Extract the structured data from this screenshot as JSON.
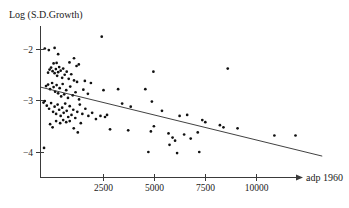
{
  "chart_data": {
    "type": "scatter",
    "title": "",
    "subtitle": "",
    "xlabel": "adp 1960",
    "ylabel": "Log (S.D.Growth)",
    "grid": false,
    "legend": null,
    "xlim": [
      0,
      11500
    ],
    "ylim": [
      -4.35,
      -1.55
    ],
    "xticks": [
      2500,
      5000,
      7500,
      10000
    ],
    "xtick_labels": [
      "2500",
      "5000",
      "7500",
      "10000"
    ],
    "yticks": [
      -2,
      -3,
      -4
    ],
    "ytick_labels": [
      "−2",
      "−3",
      "−4"
    ],
    "annotations": [],
    "series": [
      {
        "name": "countries",
        "marker": "filled-circle",
        "color": "#111111",
        "points": [
          [
            120,
            -3.04
          ],
          [
            170,
            -1.99
          ],
          [
            330,
            -2.02
          ],
          [
            520,
            -2.28
          ],
          [
            560,
            -1.98
          ],
          [
            640,
            -2.27
          ],
          [
            700,
            -2.1
          ],
          [
            2430,
            -1.76
          ],
          [
            1150,
            -2.26
          ],
          [
            1330,
            -2.18
          ],
          [
            1430,
            -2.33
          ],
          [
            1520,
            -2.3
          ],
          [
            300,
            -2.46
          ],
          [
            360,
            -2.4
          ],
          [
            420,
            -2.36
          ],
          [
            480,
            -2.43
          ],
          [
            560,
            -2.47
          ],
          [
            610,
            -2.39
          ],
          [
            660,
            -2.52
          ],
          [
            700,
            -2.45
          ],
          [
            740,
            -2.35
          ],
          [
            800,
            -2.42
          ],
          [
            860,
            -2.56
          ],
          [
            900,
            -2.38
          ],
          [
            960,
            -2.5
          ],
          [
            1040,
            -2.44
          ],
          [
            1120,
            -2.58
          ],
          [
            1220,
            -2.49
          ],
          [
            1330,
            -2.61
          ],
          [
            1450,
            -2.64
          ],
          [
            1760,
            -2.62
          ],
          [
            4480,
            -2.44
          ],
          [
            7430,
            -2.38
          ],
          [
            220,
            -2.72
          ],
          [
            300,
            -2.69
          ],
          [
            380,
            -2.78
          ],
          [
            460,
            -2.66
          ],
          [
            520,
            -2.74
          ],
          [
            580,
            -2.83
          ],
          [
            640,
            -2.7
          ],
          [
            700,
            -2.86
          ],
          [
            760,
            -2.76
          ],
          [
            820,
            -2.92
          ],
          [
            880,
            -2.68
          ],
          [
            940,
            -2.88
          ],
          [
            1020,
            -2.8
          ],
          [
            1090,
            -2.95
          ],
          [
            1180,
            -2.73
          ],
          [
            1280,
            -2.9
          ],
          [
            1390,
            -2.84
          ],
          [
            1530,
            -2.98
          ],
          [
            1700,
            -2.79
          ],
          [
            1880,
            -2.87
          ],
          [
            2500,
            -2.8
          ],
          [
            3080,
            -2.78
          ],
          [
            2000,
            -2.66
          ],
          [
            170,
            -3.01
          ],
          [
            250,
            -3.1
          ],
          [
            340,
            -3.16
          ],
          [
            420,
            -3.05
          ],
          [
            500,
            -3.22
          ],
          [
            560,
            -3.12
          ],
          [
            620,
            -3.26
          ],
          [
            680,
            -3.08
          ],
          [
            740,
            -3.18
          ],
          [
            800,
            -3.3
          ],
          [
            860,
            -3.14
          ],
          [
            920,
            -3.24
          ],
          [
            980,
            -3.06
          ],
          [
            1040,
            -3.2
          ],
          [
            1100,
            -3.32
          ],
          [
            1160,
            -3.11
          ],
          [
            1230,
            -3.28
          ],
          [
            1300,
            -3.18
          ],
          [
            1380,
            -3.34
          ],
          [
            1460,
            -3.22
          ],
          [
            1560,
            -3.08
          ],
          [
            1660,
            -3.26
          ],
          [
            1780,
            -3.16
          ],
          [
            1900,
            -3.3
          ],
          [
            2050,
            -3.24
          ],
          [
            2200,
            -3.36
          ],
          [
            2380,
            -3.3
          ],
          [
            2560,
            -3.32
          ],
          [
            2640,
            -3.28
          ],
          [
            3240,
            -3.06
          ],
          [
            3580,
            -3.12
          ],
          [
            4160,
            -2.78
          ],
          [
            4420,
            -3.02
          ],
          [
            4820,
            -3.2
          ],
          [
            5520,
            -3.3
          ],
          [
            5820,
            -3.28
          ],
          [
            6420,
            -3.38
          ],
          [
            6540,
            -3.42
          ],
          [
            7120,
            -3.48
          ],
          [
            7260,
            -3.52
          ],
          [
            7820,
            -3.54
          ],
          [
            9280,
            -3.68
          ],
          [
            10120,
            -3.68
          ],
          [
            380,
            -3.46
          ],
          [
            480,
            -3.52
          ],
          [
            620,
            -3.4
          ],
          [
            780,
            -3.44
          ],
          [
            900,
            -3.38
          ],
          [
            1020,
            -3.42
          ],
          [
            1160,
            -3.4
          ],
          [
            1320,
            -3.54
          ],
          [
            1480,
            -3.62
          ],
          [
            1600,
            -3.44
          ],
          [
            2760,
            -3.56
          ],
          [
            3480,
            -3.58
          ],
          [
            4380,
            -3.6
          ],
          [
            4500,
            -3.5
          ],
          [
            5080,
            -3.64
          ],
          [
            5240,
            -3.72
          ],
          [
            5340,
            -3.78
          ],
          [
            5700,
            -3.66
          ],
          [
            5960,
            -3.74
          ],
          [
            6240,
            -3.62
          ],
          [
            140,
            -3.92
          ],
          [
            4280,
            -4.0
          ],
          [
            5420,
            -4.02
          ],
          [
            6300,
            -4.0
          ],
          [
            5120,
            -3.86
          ]
        ]
      }
    ],
    "trend_line": {
      "name": "regression-line",
      "color": "#2b2b2b",
      "x_start": 0,
      "y_start": -2.74,
      "x_end": 11180,
      "y_end": -4.08
    }
  }
}
